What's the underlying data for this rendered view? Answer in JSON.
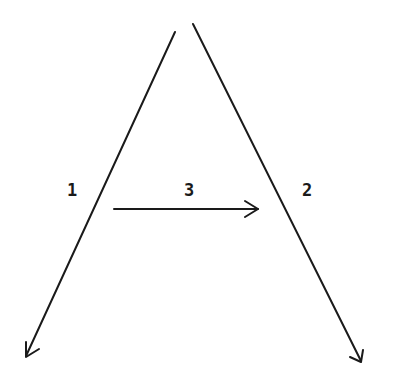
{
  "diagram": {
    "strokes": [
      {
        "id": "1",
        "label": "1",
        "from": [
          175,
          32
        ],
        "to": [
          26,
          358
        ],
        "direction": "down-left"
      },
      {
        "id": "2",
        "label": "2",
        "from": [
          193,
          24
        ],
        "to": [
          362,
          362
        ],
        "direction": "down-right"
      },
      {
        "id": "3",
        "label": "3",
        "from": [
          114,
          209
        ],
        "to": [
          258,
          209
        ],
        "direction": "right"
      }
    ],
    "labels": {
      "stroke1": "1",
      "stroke2": "2",
      "stroke3": "3"
    },
    "ink_color": "#1a1a1a"
  }
}
